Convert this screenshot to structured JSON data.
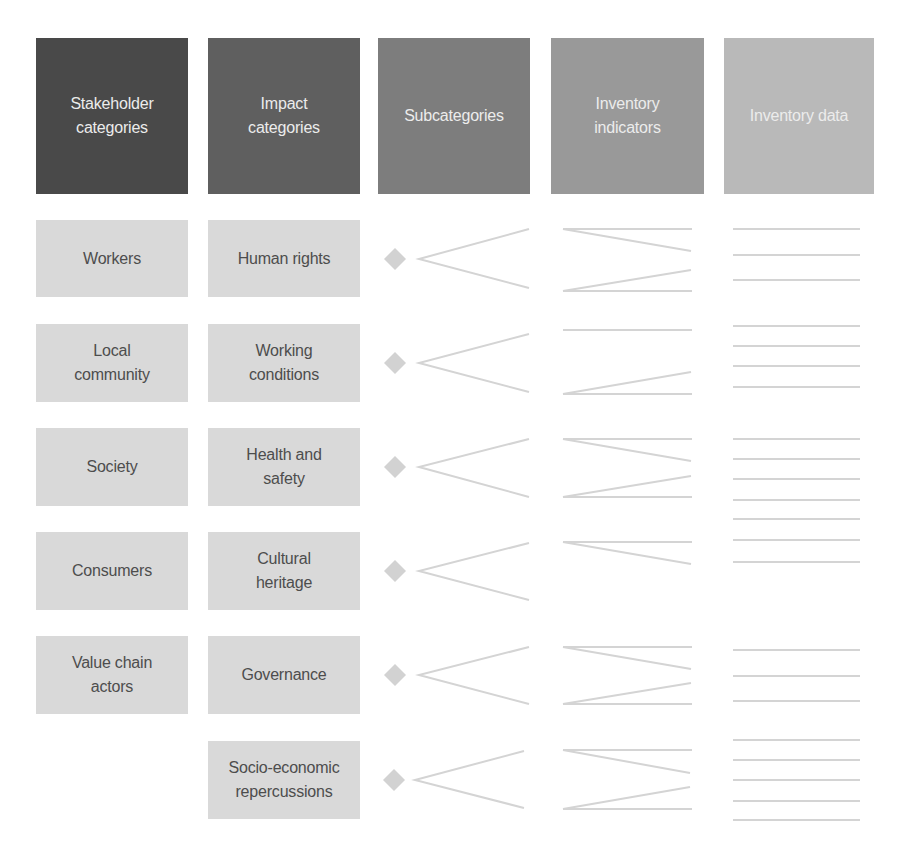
{
  "colors": {
    "header_stakeholder": "#494949",
    "header_impact": "#5f5f5f",
    "header_subcategories": "#7d7d7d",
    "header_indicators": "#999999",
    "header_data": "#b9b9b9",
    "box_fill": "#d9d9d9",
    "box_text": "#4d4d4d",
    "header_text": "#ececec",
    "line_color": "#d4d4d4",
    "diamond_color": "#d2d2d2"
  },
  "headers": [
    {
      "label": "Stakeholder\ncategories"
    },
    {
      "label": "Impact\ncategories"
    },
    {
      "label": "Subcategories"
    },
    {
      "label": "Inventory\nindicators"
    },
    {
      "label": "Inventory data"
    }
  ],
  "stakeholder_categories": [
    {
      "label": "Workers"
    },
    {
      "label": "Local\ncommunity"
    },
    {
      "label": "Society"
    },
    {
      "label": "Consumers"
    },
    {
      "label": "Value chain\nactors"
    }
  ],
  "impact_categories": [
    {
      "label": "Human rights"
    },
    {
      "label": "Working\nconditions"
    },
    {
      "label": "Health and\nsafety"
    },
    {
      "label": "Cultural\nheritage"
    },
    {
      "label": "Governance"
    },
    {
      "label": "Socio-economic\nrepercussions"
    }
  ]
}
